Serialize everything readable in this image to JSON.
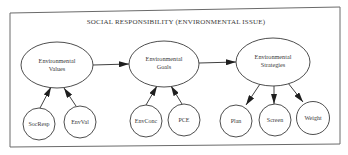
{
  "diagram": {
    "title": "SOCIAL RESPONSIBILITY (ENVIRONMENTAL ISSUE)",
    "colors": {
      "stroke": "#3a3a3a",
      "frame": "#6a6a6a",
      "text": "#3a3a3a",
      "background": "#ffffff"
    },
    "main_nodes": [
      {
        "id": "values",
        "line1": "Environmental",
        "line2": "Values"
      },
      {
        "id": "goals",
        "line1": "Environmental",
        "line2": "Goals"
      },
      {
        "id": "strategies",
        "line1": "Environmental",
        "line2": "Strategies"
      }
    ],
    "sub_nodes": [
      {
        "id": "socresp",
        "label": "SocResp",
        "parent": "values",
        "direction": "into-parent"
      },
      {
        "id": "envval",
        "label": "EnvVal",
        "parent": "values",
        "direction": "into-parent"
      },
      {
        "id": "envconc",
        "label": "EnvConc",
        "parent": "goals",
        "direction": "into-parent"
      },
      {
        "id": "pce",
        "label": "PCE",
        "parent": "goals",
        "direction": "into-parent"
      },
      {
        "id": "plan",
        "label": "Plan",
        "parent": "strategies",
        "direction": "from-parent"
      },
      {
        "id": "screen",
        "label": "Screen",
        "parent": "strategies",
        "direction": "from-parent"
      },
      {
        "id": "weight",
        "label": "Weight",
        "parent": "strategies",
        "direction": "from-parent"
      }
    ],
    "edges": [
      {
        "from": "values",
        "to": "goals"
      },
      {
        "from": "goals",
        "to": "strategies"
      },
      {
        "from": "socresp",
        "to": "values"
      },
      {
        "from": "envval",
        "to": "values"
      },
      {
        "from": "envconc",
        "to": "goals"
      },
      {
        "from": "pce",
        "to": "goals"
      },
      {
        "from": "strategies",
        "to": "plan"
      },
      {
        "from": "strategies",
        "to": "screen"
      },
      {
        "from": "strategies",
        "to": "weight"
      }
    ]
  }
}
